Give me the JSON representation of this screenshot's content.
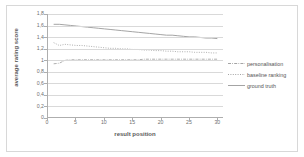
{
  "chart_data": {
    "type": "line",
    "title": "",
    "xlabel": "result position",
    "ylabel": "average rating score",
    "xlim": [
      0,
      31
    ],
    "ylim": [
      0,
      1.8
    ],
    "grid": true,
    "legend_position": "right",
    "x_ticks": [
      "0",
      "5",
      "10",
      "15",
      "20",
      "25",
      "30"
    ],
    "x_tick_values": [
      0,
      5,
      10,
      15,
      20,
      25,
      30
    ],
    "y_ticks": [
      "0",
      "0,2",
      "0,4",
      "0,6",
      "0,8",
      "1",
      "1,2",
      "1,4",
      "1,6",
      "1,8"
    ],
    "y_tick_values": [
      0,
      0.2,
      0.4,
      0.6,
      0.8,
      1.0,
      1.2,
      1.4,
      1.6,
      1.8
    ],
    "x": [
      1,
      2,
      3,
      4,
      5,
      6,
      7,
      8,
      9,
      10,
      11,
      12,
      13,
      14,
      15,
      16,
      17,
      18,
      19,
      20,
      21,
      22,
      23,
      24,
      25,
      26,
      27,
      28,
      29,
      30
    ],
    "series": [
      {
        "name": "personalisation",
        "style": "dash-dot",
        "color": "#9a9a9a",
        "values": [
          0.93,
          0.94,
          0.99,
          1.0,
          1.0,
          1.0,
          1.0,
          1.0,
          1.0,
          1.0,
          1.0,
          1.0,
          1.0,
          1.0,
          1.0,
          1.0,
          1.01,
          1.01,
          1.01,
          1.01,
          1.01,
          1.01,
          1.01,
          1.01,
          1.01,
          1.01,
          1.01,
          1.01,
          1.01,
          1.01
        ]
      },
      {
        "name": "baseline ranking",
        "style": "dotted",
        "color": "#9a9a9a",
        "values": [
          1.3,
          1.25,
          1.27,
          1.26,
          1.25,
          1.25,
          1.24,
          1.23,
          1.22,
          1.21,
          1.2,
          1.2,
          1.19,
          1.19,
          1.18,
          1.18,
          1.17,
          1.17,
          1.16,
          1.16,
          1.15,
          1.15,
          1.14,
          1.14,
          1.14,
          1.13,
          1.13,
          1.13,
          1.12,
          1.12
        ]
      },
      {
        "name": "ground truth",
        "style": "solid",
        "color": "#9a9a9a",
        "values": [
          1.62,
          1.62,
          1.61,
          1.6,
          1.59,
          1.58,
          1.57,
          1.56,
          1.55,
          1.54,
          1.53,
          1.52,
          1.51,
          1.5,
          1.49,
          1.48,
          1.47,
          1.46,
          1.45,
          1.44,
          1.43,
          1.43,
          1.42,
          1.41,
          1.4,
          1.4,
          1.39,
          1.38,
          1.38,
          1.37
        ]
      }
    ]
  }
}
